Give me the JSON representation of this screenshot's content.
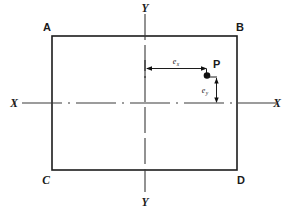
{
  "diagram": {
    "type": "engineering-line-diagram",
    "colors": {
      "outline": "#1c1c1c",
      "centerline": "#3a3a3a",
      "dimension": "#1c1c1c",
      "background": "#ffffff",
      "text": "#1a1a1a"
    },
    "corner_labels": {
      "top_left": "A",
      "top_right": "B",
      "bottom_left": "C",
      "bottom_right": "D"
    },
    "axis_labels": {
      "vertical_top": "Y",
      "vertical_bottom": "Y",
      "horizontal_left": "X",
      "horizontal_right": "X"
    },
    "point": {
      "label": "P",
      "marker": "filled-dot"
    },
    "dimensions": [
      {
        "name": "eccentricity-x",
        "symbol": "e",
        "subscript": "x",
        "orientation": "horizontal",
        "from": "vertical-centerline",
        "to": "point-P"
      },
      {
        "name": "eccentricity-y",
        "symbol": "e",
        "subscript": "y",
        "orientation": "vertical",
        "from": "point-P",
        "to": "horizontal-centerline"
      }
    ],
    "geometry": {
      "rect_left": 52,
      "rect_top": 36,
      "rect_right": 237,
      "rect_bottom": 170,
      "center_x": 145,
      "center_y": 103,
      "point_x": 207,
      "point_y": 71
    }
  }
}
